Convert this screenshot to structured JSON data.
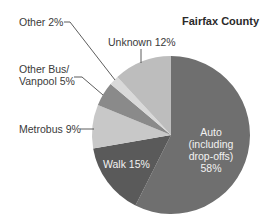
{
  "chart_data": {
    "type": "pie",
    "title": "Fairfax County",
    "categories": [
      "Auto (including drop-offs)",
      "Walk",
      "Metrobus",
      "Other Bus/Vanpool",
      "Other",
      "Unknown"
    ],
    "values": [
      58,
      15,
      9,
      5,
      2,
      12
    ],
    "unit": "%",
    "colors": [
      "#6f6f6f",
      "#5a5a5a",
      "#c8c8c8",
      "#8a8a8a",
      "#d9d9d9",
      "#bdbdbd"
    ],
    "start_angle": "12 o'clock",
    "direction": "clockwise",
    "legend": "none (leader-line labels)"
  },
  "labels": {
    "title": "Fairfax County",
    "auto_l1": "Auto",
    "auto_l2": "(including",
    "auto_l3": "drop-offs)",
    "auto_l4": "58%",
    "walk": "Walk 15%",
    "metrobus": "Metrobus 9%",
    "otherbus_l1": "Other Bus/",
    "otherbus_l2": "Vanpool 5%",
    "other": "Other 2%",
    "unknown": "Unknown 12%"
  }
}
